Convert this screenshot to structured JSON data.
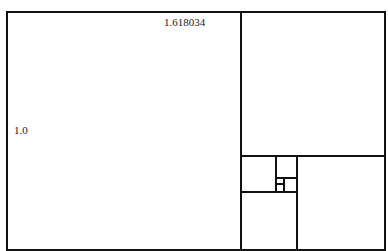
{
  "diagram": {
    "labels": {
      "width": "1.618034",
      "height": "1.0"
    },
    "colors": {
      "stroke": "#111111",
      "background": "#ffffff",
      "text": "#222222"
    }
  }
}
